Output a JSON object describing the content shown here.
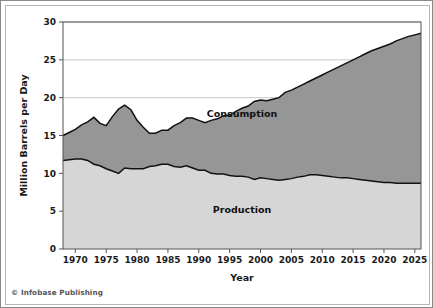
{
  "credit": "© Infobase Publishing",
  "chart_data": {
    "type": "area",
    "title": "",
    "subtitle": "",
    "xlabel": "Year",
    "ylabel": "Million Barrels per Day",
    "xlim": [
      1968,
      2026
    ],
    "ylim": [
      0,
      30
    ],
    "xticks": [
      1970,
      1975,
      1980,
      1985,
      1990,
      1995,
      2000,
      2005,
      2010,
      2015,
      2020,
      2025
    ],
    "yticks": [
      0,
      5,
      10,
      15,
      20,
      25,
      30
    ],
    "grid": "horizontal",
    "stacked": true,
    "legend_position": "inline-labels",
    "colors": {
      "consumption_fill": "#969696",
      "production_fill": "#d6d6d6",
      "line": "#111111",
      "grid": "#b9b9b9",
      "axis": "#555555",
      "frame_outer": "#8a8a8a",
      "frame_inner": "#b5b5b5"
    },
    "annotations": [
      {
        "text": "Consumption",
        "x": 1997,
        "y": 17.4
      },
      {
        "text": "Production",
        "x": 1997,
        "y": 4.8
      }
    ],
    "series": [
      {
        "name": "Production",
        "label": "Production",
        "fill": "#d6d6d6",
        "x": [
          1968,
          1969,
          1970,
          1971,
          1972,
          1973,
          1974,
          1975,
          1976,
          1977,
          1978,
          1979,
          1980,
          1981,
          1982,
          1983,
          1984,
          1985,
          1986,
          1987,
          1988,
          1989,
          1990,
          1991,
          1992,
          1993,
          1994,
          1995,
          1996,
          1997,
          1998,
          1999,
          2000,
          2001,
          2002,
          2003,
          2004,
          2005,
          2006,
          2007,
          2008,
          2009,
          2010,
          2011,
          2012,
          2013,
          2014,
          2015,
          2016,
          2017,
          2018,
          2019,
          2020,
          2021,
          2022,
          2023,
          2024,
          2025,
          2026
        ],
        "values": [
          11.7,
          11.8,
          11.9,
          11.9,
          11.7,
          11.2,
          11.0,
          10.6,
          10.3,
          10.0,
          10.7,
          10.6,
          10.6,
          10.6,
          10.9,
          11.0,
          11.2,
          11.2,
          10.9,
          10.8,
          11.0,
          10.7,
          10.4,
          10.4,
          10.0,
          9.9,
          9.9,
          9.7,
          9.6,
          9.6,
          9.5,
          9.2,
          9.4,
          9.3,
          9.2,
          9.1,
          9.2,
          9.3,
          9.5,
          9.6,
          9.8,
          9.8,
          9.7,
          9.6,
          9.5,
          9.4,
          9.4,
          9.3,
          9.2,
          9.1,
          9.0,
          8.9,
          8.8,
          8.8,
          8.7,
          8.7,
          8.7,
          8.7,
          8.7
        ],
        "units": "million barrels per day"
      },
      {
        "name": "Consumption",
        "label": "Consumption",
        "fill": "#969696",
        "x": [
          1968,
          1969,
          1970,
          1971,
          1972,
          1973,
          1974,
          1975,
          1976,
          1977,
          1978,
          1979,
          1980,
          1981,
          1982,
          1983,
          1984,
          1985,
          1986,
          1987,
          1988,
          1989,
          1990,
          1991,
          1992,
          1993,
          1994,
          1995,
          1996,
          1997,
          1998,
          1999,
          2000,
          2001,
          2002,
          2003,
          2004,
          2005,
          2006,
          2007,
          2008,
          2009,
          2010,
          2011,
          2012,
          2013,
          2014,
          2015,
          2016,
          2017,
          2018,
          2019,
          2020,
          2021,
          2022,
          2023,
          2024,
          2025,
          2026
        ],
        "values": [
          15.0,
          15.4,
          15.8,
          16.4,
          16.8,
          17.4,
          16.6,
          16.3,
          17.5,
          18.5,
          19.0,
          18.4,
          17.0,
          16.1,
          15.3,
          15.3,
          15.7,
          15.7,
          16.3,
          16.7,
          17.3,
          17.3,
          17.0,
          16.7,
          17.0,
          17.2,
          17.6,
          17.7,
          18.2,
          18.6,
          18.9,
          19.5,
          19.7,
          19.6,
          19.8,
          20.0,
          20.7,
          21.0,
          21.4,
          21.8,
          22.2,
          22.6,
          23.0,
          23.4,
          23.8,
          24.2,
          24.6,
          25.0,
          25.4,
          25.8,
          26.2,
          26.5,
          26.8,
          27.1,
          27.5,
          27.8,
          28.1,
          28.3,
          28.5
        ],
        "units": "million barrels per day"
      }
    ]
  }
}
